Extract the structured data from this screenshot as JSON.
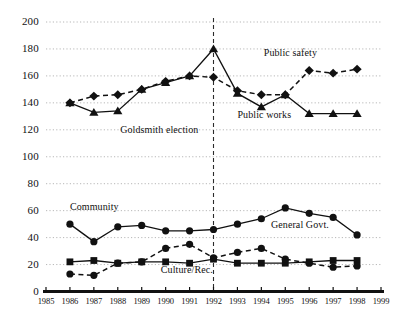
{
  "chart_data": {
    "type": "line",
    "title": "",
    "xlabel": "",
    "ylabel": "",
    "xlim": [
      1985,
      1999
    ],
    "ylim": [
      0,
      200
    ],
    "yticks": [
      0,
      20,
      40,
      60,
      80,
      100,
      120,
      140,
      160,
      180,
      200
    ],
    "xticks": [
      1985,
      1986,
      1987,
      1988,
      1989,
      1990,
      1991,
      1992,
      1993,
      1994,
      1995,
      1996,
      1997,
      1998,
      1999
    ],
    "grid": "horizontal-dotted",
    "legend": "inline-annotations",
    "x": [
      1986,
      1987,
      1988,
      1989,
      1990,
      1991,
      1992,
      1993,
      1994,
      1995,
      1996,
      1997,
      1998
    ],
    "series": [
      {
        "name": "Public safety",
        "marker": "diamond",
        "line": "dashed",
        "values": [
          140,
          145,
          146,
          150,
          156,
          160,
          159,
          149,
          146,
          146,
          164,
          162,
          165
        ]
      },
      {
        "name": "Public works",
        "marker": "triangle",
        "line": "solid",
        "values": [
          140,
          133,
          134,
          150,
          155,
          160,
          180,
          147,
          137,
          146,
          132,
          132,
          132
        ]
      },
      {
        "name": "General Govt.",
        "marker": "circle",
        "line": "solid",
        "values": [
          50,
          37,
          48,
          49,
          45,
          45,
          46,
          50,
          54,
          62,
          58,
          55,
          42
        ]
      },
      {
        "name": "Culture/Rec.",
        "marker": "square",
        "line": "solid",
        "values": [
          22,
          23,
          21,
          22,
          22,
          21,
          24,
          21,
          21,
          21,
          22,
          23,
          23
        ]
      },
      {
        "name": "Community",
        "marker": "circle",
        "line": "dashed",
        "values": [
          13,
          12,
          21,
          22,
          32,
          35,
          25,
          29,
          32,
          24,
          21,
          18,
          19
        ]
      }
    ],
    "annotations": [
      {
        "text": "Public safety",
        "x": 1994.1,
        "y": 177
      },
      {
        "text": "Public works",
        "x": 1993.0,
        "y": 131
      },
      {
        "text": "Goldsmith election",
        "x": 1988.1,
        "y": 120
      },
      {
        "text": "Community",
        "x": 1986.0,
        "y": 63
      },
      {
        "text": "General Govt.",
        "x": 1994.4,
        "y": 49
      },
      {
        "text": "Culture/Rec.",
        "x": 1989.8,
        "y": 16
      }
    ],
    "reference_line": {
      "label": "Goldsmith election",
      "x": 1992,
      "style": "dashed-vertical"
    }
  },
  "colors": {
    "ink": "#111111",
    "grid": "#9a9a9a",
    "background": "#ffffff"
  }
}
